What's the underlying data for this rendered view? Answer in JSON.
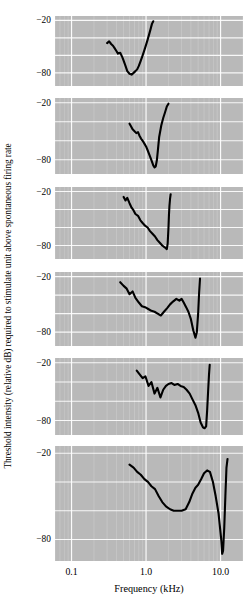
{
  "figure": {
    "ylabel": "Threshold intensity (relative dB) required to stimulate unit above spontaneous firing rate",
    "xlabel": "Frequency (kHz)",
    "panel_bg": "#b9b9b9",
    "grid_color": "#ffffff",
    "curve_color": "#000000"
  },
  "axis": {
    "x_ticks": [
      {
        "label": "0.1",
        "value": 0.1
      },
      {
        "label": "1.0",
        "value": 1.0
      },
      {
        "label": "10.0",
        "value": 10.0
      }
    ],
    "y_ticks_top": "−20",
    "y_ticks_bottom": "−80"
  },
  "chart_data": {
    "type": "line",
    "title": "",
    "xlabel": "Frequency (kHz)",
    "ylabel": "Threshold intensity (relative dB) required to stimulate unit above spontaneous firing rate",
    "xscale": "log",
    "xlim": [
      0.06,
      20.0
    ],
    "ylim": [
      -95,
      -15
    ],
    "grid": true,
    "legend": "none",
    "xtick_labels": [
      "0.1",
      "1.0",
      "10.0"
    ],
    "xtick_values": [
      0.1,
      1.0,
      10.0
    ],
    "ytick_labels": [
      "−20",
      "−80"
    ],
    "ytick_values": [
      -20,
      -80
    ],
    "panel_count": 6,
    "panels": [
      {
        "name": "tuning-curve-1",
        "best_frequency_khz": 0.5,
        "threshold_at_bf_db": -82,
        "x": [
          0.3,
          0.32,
          0.34,
          0.36,
          0.38,
          0.4,
          0.42,
          0.45,
          0.48,
          0.5,
          0.53,
          0.56,
          0.6,
          0.64,
          0.68,
          0.72,
          0.76,
          0.8,
          0.85,
          0.9,
          0.95,
          1.0,
          1.05,
          1.1,
          1.15,
          1.2,
          1.25
        ],
        "y": [
          -46,
          -44,
          -47,
          -49,
          -52,
          -55,
          -58,
          -57,
          -62,
          -66,
          -72,
          -78,
          -81,
          -82,
          -80,
          -78,
          -76,
          -72,
          -66,
          -60,
          -54,
          -48,
          -42,
          -36,
          -30,
          -24,
          -21
        ]
      },
      {
        "name": "tuning-curve-2",
        "best_frequency_khz": 1.35,
        "threshold_at_bf_db": -88,
        "x": [
          0.6,
          0.63,
          0.66,
          0.7,
          0.74,
          0.78,
          0.82,
          0.86,
          0.9,
          0.95,
          1.0,
          1.05,
          1.1,
          1.15,
          1.2,
          1.25,
          1.3,
          1.35,
          1.4,
          1.45,
          1.5,
          1.6,
          1.7,
          1.8,
          1.9,
          2.0
        ],
        "y": [
          -42,
          -45,
          -48,
          -50,
          -52,
          -51,
          -55,
          -58,
          -60,
          -63,
          -66,
          -70,
          -74,
          -78,
          -82,
          -86,
          -88,
          -87,
          -80,
          -68,
          -56,
          -44,
          -36,
          -30,
          -24,
          -21
        ]
      },
      {
        "name": "tuning-curve-3",
        "best_frequency_khz": 2.0,
        "threshold_at_bf_db": -84,
        "x": [
          0.5,
          0.53,
          0.56,
          0.6,
          0.64,
          0.68,
          0.72,
          0.78,
          0.84,
          0.9,
          0.97,
          1.05,
          1.13,
          1.22,
          1.32,
          1.42,
          1.53,
          1.65,
          1.78,
          1.9,
          1.95,
          2.0,
          2.03,
          2.06,
          2.1,
          2.14
        ],
        "y": [
          -26,
          -30,
          -27,
          -33,
          -38,
          -41,
          -45,
          -47,
          -52,
          -55,
          -58,
          -60,
          -64,
          -67,
          -70,
          -74,
          -77,
          -80,
          -82,
          -84,
          -78,
          -60,
          -46,
          -36,
          -28,
          -23
        ]
      },
      {
        "name": "tuning-curve-4",
        "best_frequency_khz": 4.6,
        "threshold_at_bf_db": -86,
        "x": [
          0.45,
          0.5,
          0.55,
          0.6,
          0.66,
          0.72,
          0.8,
          0.88,
          0.97,
          1.07,
          1.18,
          1.3,
          1.43,
          1.58,
          1.74,
          1.92,
          2.1,
          2.3,
          2.55,
          2.8,
          3.0,
          3.2,
          3.45,
          3.7,
          4.0,
          4.3,
          4.6,
          4.8,
          5.0,
          5.15,
          5.3
        ],
        "y": [
          -26,
          -30,
          -33,
          -39,
          -36,
          -43,
          -48,
          -52,
          -53,
          -55,
          -57,
          -58,
          -60,
          -62,
          -58,
          -54,
          -50,
          -47,
          -44,
          -46,
          -44,
          -48,
          -53,
          -58,
          -66,
          -78,
          -86,
          -80,
          -60,
          -38,
          -22
        ]
      },
      {
        "name": "tuning-curve-5",
        "best_frequency_khz": 6.4,
        "threshold_at_bf_db": -88,
        "x": [
          0.75,
          0.82,
          0.9,
          0.98,
          1.08,
          1.18,
          1.3,
          1.42,
          1.56,
          1.7,
          1.85,
          2.0,
          2.2,
          2.4,
          2.65,
          2.9,
          3.2,
          3.5,
          3.85,
          4.2,
          4.6,
          5.0,
          5.4,
          5.8,
          6.1,
          6.4,
          6.6,
          6.8,
          7.0,
          7.15
        ],
        "y": [
          -28,
          -32,
          -36,
          -34,
          -44,
          -40,
          -52,
          -46,
          -56,
          -48,
          -44,
          -42,
          -41,
          -43,
          -42,
          -44,
          -45,
          -48,
          -52,
          -58,
          -64,
          -72,
          -82,
          -87,
          -88,
          -86,
          -70,
          -50,
          -32,
          -22
        ]
      },
      {
        "name": "tuning-curve-6",
        "best_frequency_khz": 10.5,
        "threshold_at_bf_db": -90,
        "x": [
          0.6,
          0.68,
          0.76,
          0.85,
          0.95,
          1.06,
          1.18,
          1.32,
          1.48,
          1.65,
          1.85,
          2.1,
          2.35,
          2.65,
          3.0,
          3.4,
          3.8,
          4.2,
          4.6,
          5.0,
          5.5,
          6.0,
          6.6,
          7.2,
          7.9,
          8.6,
          9.4,
          10.2,
          10.5,
          10.8,
          11.2,
          11.6,
          12.0,
          12.4
        ],
        "y": [
          -28,
          -30,
          -33,
          -35,
          -38,
          -40,
          -43,
          -45,
          -50,
          -54,
          -57,
          -59,
          -60,
          -60,
          -60,
          -59,
          -54,
          -48,
          -44,
          -42,
          -38,
          -34,
          -32,
          -33,
          -40,
          -50,
          -62,
          -80,
          -90,
          -88,
          -72,
          -50,
          -30,
          -24
        ]
      }
    ]
  }
}
